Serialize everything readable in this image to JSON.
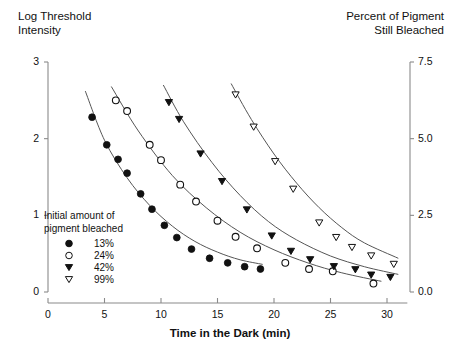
{
  "titles": {
    "left_axis": "Log Threshold\nIntensity",
    "right_axis": "Percent of Pigment\nStill Bleached",
    "x_axis": "Time in the Dark (min)"
  },
  "legend": {
    "heading": "Initial amount of\npigment bleached",
    "items": [
      {
        "label": "13%",
        "marker": "filled-circle"
      },
      {
        "label": "24%",
        "marker": "open-circle"
      },
      {
        "label": "42%",
        "marker": "filled-triangle-down"
      },
      {
        "label": "99%",
        "marker": "open-triangle-down"
      }
    ]
  },
  "axes": {
    "left_ticks": [
      "0",
      "1",
      "2",
      "3"
    ],
    "right_ticks": [
      "0.0",
      "2.5",
      "5.0",
      "7.5"
    ],
    "x_ticks": [
      "0",
      "5",
      "10",
      "15",
      "20",
      "25",
      "30"
    ]
  },
  "chart_data": {
    "type": "scatter",
    "title": "",
    "xlabel": "Time in the Dark (min)",
    "ylabel": "Log Threshold Intensity",
    "y2label": "Percent of Pigment Still Bleached",
    "xlim": [
      0,
      31
    ],
    "ylim": [
      0,
      3
    ],
    "y2lim": [
      0.0,
      7.5
    ],
    "grid": false,
    "legend_position": "lower-left",
    "left_tick_values": [
      0,
      1,
      2,
      3
    ],
    "right_tick_values": [
      0.0,
      2.5,
      5.0,
      7.5
    ],
    "x_tick_values": [
      0,
      5,
      10,
      15,
      20,
      25,
      30
    ],
    "series": [
      {
        "name": "13%",
        "marker": "filled-circle",
        "points": [
          {
            "x": 3.9,
            "y": 2.28
          },
          {
            "x": 5.2,
            "y": 1.92
          },
          {
            "x": 6.2,
            "y": 1.73
          },
          {
            "x": 7.0,
            "y": 1.55
          },
          {
            "x": 8.2,
            "y": 1.28
          },
          {
            "x": 9.2,
            "y": 1.08
          },
          {
            "x": 10.3,
            "y": 0.87
          },
          {
            "x": 11.4,
            "y": 0.71
          },
          {
            "x": 12.7,
            "y": 0.56
          },
          {
            "x": 14.3,
            "y": 0.44
          },
          {
            "x": 15.9,
            "y": 0.38
          },
          {
            "x": 17.4,
            "y": 0.33
          },
          {
            "x": 18.8,
            "y": 0.3
          }
        ],
        "fit_curve": [
          {
            "x": 3.3,
            "y": 2.62
          },
          {
            "x": 5.0,
            "y": 1.98
          },
          {
            "x": 7.0,
            "y": 1.49
          },
          {
            "x": 9.0,
            "y": 1.13
          },
          {
            "x": 11.0,
            "y": 0.86
          },
          {
            "x": 13.0,
            "y": 0.66
          },
          {
            "x": 15.0,
            "y": 0.52
          },
          {
            "x": 17.0,
            "y": 0.42
          },
          {
            "x": 19.0,
            "y": 0.36
          }
        ]
      },
      {
        "name": "24%",
        "marker": "open-circle",
        "points": [
          {
            "x": 6.0,
            "y": 2.5
          },
          {
            "x": 7.0,
            "y": 2.36
          },
          {
            "x": 9.0,
            "y": 1.92
          },
          {
            "x": 10.0,
            "y": 1.72
          },
          {
            "x": 11.7,
            "y": 1.4
          },
          {
            "x": 13.1,
            "y": 1.18
          },
          {
            "x": 15.0,
            "y": 0.93
          },
          {
            "x": 16.6,
            "y": 0.72
          },
          {
            "x": 18.5,
            "y": 0.57
          },
          {
            "x": 21.0,
            "y": 0.38
          },
          {
            "x": 23.1,
            "y": 0.3
          },
          {
            "x": 25.2,
            "y": 0.27
          },
          {
            "x": 28.8,
            "y": 0.11
          }
        ],
        "fit_curve": [
          {
            "x": 5.6,
            "y": 2.68
          },
          {
            "x": 8.0,
            "y": 2.1
          },
          {
            "x": 11.0,
            "y": 1.52
          },
          {
            "x": 14.0,
            "y": 1.1
          },
          {
            "x": 17.0,
            "y": 0.78
          },
          {
            "x": 20.0,
            "y": 0.55
          },
          {
            "x": 23.0,
            "y": 0.38
          },
          {
            "x": 26.0,
            "y": 0.25
          },
          {
            "x": 29.5,
            "y": 0.14
          }
        ]
      },
      {
        "name": "42%",
        "marker": "filled-triangle-down",
        "points": [
          {
            "x": 10.7,
            "y": 2.47
          },
          {
            "x": 11.6,
            "y": 2.25
          },
          {
            "x": 13.5,
            "y": 1.8
          },
          {
            "x": 15.4,
            "y": 1.44
          },
          {
            "x": 17.6,
            "y": 1.07
          },
          {
            "x": 19.8,
            "y": 0.73
          },
          {
            "x": 21.5,
            "y": 0.53
          },
          {
            "x": 23.2,
            "y": 0.42
          },
          {
            "x": 25.3,
            "y": 0.33
          },
          {
            "x": 27.2,
            "y": 0.29
          },
          {
            "x": 28.6,
            "y": 0.22
          },
          {
            "x": 30.3,
            "y": 0.19
          }
        ],
        "fit_curve": [
          {
            "x": 10.2,
            "y": 2.7
          },
          {
            "x": 12.0,
            "y": 2.22
          },
          {
            "x": 14.5,
            "y": 1.69
          },
          {
            "x": 17.0,
            "y": 1.26
          },
          {
            "x": 19.5,
            "y": 0.92
          },
          {
            "x": 22.0,
            "y": 0.68
          },
          {
            "x": 25.0,
            "y": 0.47
          },
          {
            "x": 28.0,
            "y": 0.33
          },
          {
            "x": 31.0,
            "y": 0.23
          }
        ]
      },
      {
        "name": "99%",
        "marker": "open-triangle-down",
        "points": [
          {
            "x": 16.6,
            "y": 2.57
          },
          {
            "x": 18.2,
            "y": 2.15
          },
          {
            "x": 20.1,
            "y": 1.7
          },
          {
            "x": 21.7,
            "y": 1.34
          },
          {
            "x": 24.0,
            "y": 0.9
          },
          {
            "x": 25.5,
            "y": 0.71
          },
          {
            "x": 26.9,
            "y": 0.58
          },
          {
            "x": 28.6,
            "y": 0.47
          },
          {
            "x": 30.6,
            "y": 0.36
          }
        ],
        "fit_curve": [
          {
            "x": 16.2,
            "y": 2.72
          },
          {
            "x": 18.0,
            "y": 2.25
          },
          {
            "x": 20.0,
            "y": 1.8
          },
          {
            "x": 22.0,
            "y": 1.42
          },
          {
            "x": 24.0,
            "y": 1.1
          },
          {
            "x": 26.0,
            "y": 0.84
          },
          {
            "x": 28.0,
            "y": 0.64
          },
          {
            "x": 31.0,
            "y": 0.44
          }
        ]
      }
    ]
  },
  "colors": {
    "axis": "#8a8a8a",
    "marker": "#111111",
    "curve": "#555555",
    "text": "#111111"
  }
}
